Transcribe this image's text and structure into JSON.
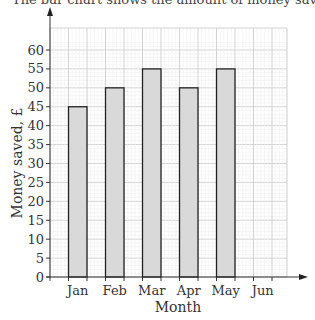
{
  "caption": "The bar chart shows the amount of money saved",
  "chart_data": {
    "type": "bar",
    "title": "",
    "xlabel": "Month",
    "ylabel": "Money saved, £",
    "categories": [
      "Jan",
      "Feb",
      "Mar",
      "Apr",
      "May",
      "Jun"
    ],
    "values": [
      45,
      50,
      55,
      50,
      55,
      null
    ],
    "yticks": [
      0,
      5,
      10,
      15,
      20,
      25,
      30,
      35,
      40,
      45,
      50,
      55,
      60
    ],
    "ylim": [
      0,
      62
    ],
    "grid": true,
    "legend": null,
    "bar_fill": "#d9d9d9",
    "bar_edge": "#222222",
    "grid_color": "#cfcfcf"
  }
}
